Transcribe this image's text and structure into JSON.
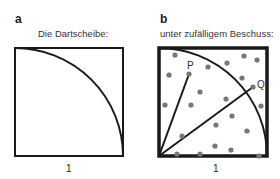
{
  "panels": [
    {
      "letter": "a",
      "title": "Die Dartscheibe:",
      "side_label": "1",
      "square": {
        "x": 15,
        "y": 48,
        "size": 108
      },
      "stroke_color": "#1a1a1a"
    },
    {
      "letter": "b",
      "title": "unter zufälligem Beschuss:",
      "side_label": "1",
      "square": {
        "x": 159,
        "y": 48,
        "size": 108
      },
      "stroke_color": "#1a1a1a",
      "dot_color": "#777777",
      "points": [
        {
          "label": "P",
          "x": 189,
          "y": 74
        },
        {
          "label": "Q",
          "x": 253,
          "y": 87
        }
      ],
      "dots": [
        [
          175,
          55
        ],
        [
          169,
          75
        ],
        [
          189,
          74
        ],
        [
          208,
          67
        ],
        [
          227,
          63
        ],
        [
          244,
          56
        ],
        [
          257,
          60
        ],
        [
          242,
          78
        ],
        [
          253,
          87
        ],
        [
          200,
          92
        ],
        [
          226,
          99
        ],
        [
          165,
          105
        ],
        [
          191,
          105
        ],
        [
          261,
          106
        ],
        [
          232,
          116
        ],
        [
          216,
          125
        ],
        [
          182,
          136
        ],
        [
          247,
          131
        ],
        [
          215,
          146
        ],
        [
          231,
          150
        ],
        [
          177,
          154
        ],
        [
          200,
          154
        ],
        [
          259,
          156
        ]
      ]
    }
  ]
}
